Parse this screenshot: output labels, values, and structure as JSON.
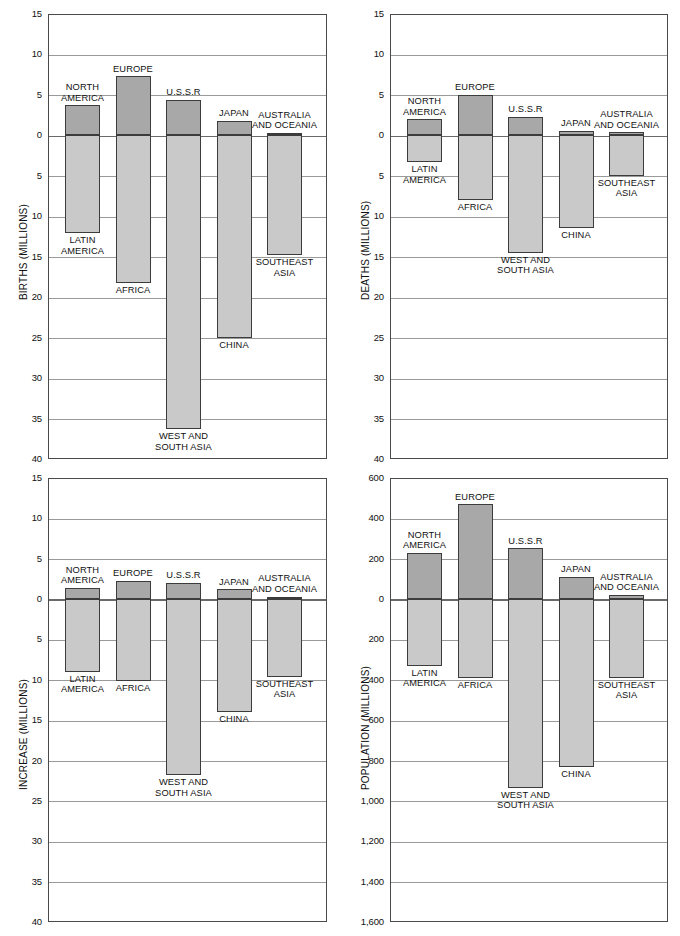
{
  "figure": {
    "regions": [
      "NORTH AMERICA",
      "LATIN AMERICA",
      "EUROPE",
      "AFRICA",
      "U.S.S.R",
      "WEST AND SOUTH ASIA",
      "JAPAN",
      "CHINA",
      "AUSTRALIA AND OCEANIA",
      "SOUTHEAST ASIA"
    ]
  },
  "chart_data": [
    {
      "id": "births",
      "type": "bar",
      "title": "",
      "ylabel": "BIRTHS (MILLIONS)",
      "xlabel": "",
      "ylim": [
        -40,
        15
      ],
      "grid": true,
      "legend": "none",
      "yticks": [
        15,
        10,
        5,
        0,
        5,
        10,
        15,
        20,
        25,
        30,
        35,
        40
      ],
      "ytick_values": [
        15,
        10,
        5,
        0,
        -5,
        -10,
        -15,
        -20,
        -25,
        -30,
        -35,
        -40
      ],
      "pairs": [
        {
          "top_label": "NORTH\nAMERICA",
          "bottom_label": "LATIN\nAMERICA",
          "up": 3.7,
          "down": -12.1
        },
        {
          "top_label": "EUROPE",
          "bottom_label": "AFRICA",
          "up": 7.3,
          "down": -18.2
        },
        {
          "top_label": "U.S.S.R",
          "bottom_label": "WEST AND\nSOUTH ASIA",
          "up": 4.4,
          "down": -36.3
        },
        {
          "top_label": "JAPAN",
          "bottom_label": "CHINA",
          "up": 1.8,
          "down": -25.1
        },
        {
          "top_label": "AUSTRALIA\nAND OCEANIA",
          "bottom_label": "SOUTHEAST\nASIA",
          "up": 0.3,
          "down": -14.8
        }
      ]
    },
    {
      "id": "deaths",
      "type": "bar",
      "title": "",
      "ylabel": "DEATHS (MILLIONS)",
      "xlabel": "",
      "ylim": [
        -40,
        15
      ],
      "grid": true,
      "legend": "none",
      "yticks": [
        15,
        10,
        5,
        0,
        5,
        10,
        15,
        20,
        25,
        30,
        35,
        40
      ],
      "ytick_values": [
        15,
        10,
        5,
        0,
        -5,
        -10,
        -15,
        -20,
        -25,
        -30,
        -35,
        -40
      ],
      "pairs": [
        {
          "top_label": "NORTH\nAMERICA",
          "bottom_label": "LATIN\nAMERICA",
          "up": 2.0,
          "down": -3.3
        },
        {
          "top_label": "EUROPE",
          "bottom_label": "AFRICA",
          "up": 5.0,
          "down": -8.0
        },
        {
          "top_label": "U.S.S.R",
          "bottom_label": "WEST AND\nSOUTH ASIA",
          "up": 2.3,
          "down": -14.5
        },
        {
          "top_label": "JAPAN",
          "bottom_label": "CHINA",
          "up": 0.6,
          "down": -11.5
        },
        {
          "top_label": "AUSTRALIA\nAND OCEANIA",
          "bottom_label": "SOUTHEAST\nASIA",
          "up": 0.4,
          "down": -5.0
        }
      ]
    },
    {
      "id": "increase",
      "type": "bar",
      "title": "",
      "ylabel": "INCREASE (MILLIONS)",
      "xlabel": "",
      "ylim": [
        -40,
        15
      ],
      "grid": true,
      "legend": "none",
      "yticks": [
        15,
        10,
        5,
        0,
        5,
        10,
        15,
        20,
        25,
        30,
        35,
        40
      ],
      "ytick_values": [
        15,
        10,
        5,
        0,
        -5,
        -10,
        -15,
        -20,
        -25,
        -30,
        -35,
        -40
      ],
      "pairs": [
        {
          "top_label": "NORTH\nAMERICA",
          "bottom_label": "LATIN\nAMERICA",
          "up": 1.4,
          "down": -9.0
        },
        {
          "top_label": "EUROPE",
          "bottom_label": "AFRICA",
          "up": 2.3,
          "down": -10.2
        },
        {
          "top_label": "U.S.S.R",
          "bottom_label": "WEST AND\nSOUTH ASIA",
          "up": 2.0,
          "down": -21.8
        },
        {
          "top_label": "JAPAN",
          "bottom_label": "CHINA",
          "up": 1.2,
          "down": -14.0
        },
        {
          "top_label": "AUSTRALIA\nAND OCEANIA",
          "bottom_label": "SOUTHEAST\nASIA",
          "up": 0.3,
          "down": -9.6
        }
      ]
    },
    {
      "id": "population",
      "type": "bar",
      "title": "",
      "ylabel": "POPULATION (MILLIONS)",
      "xlabel": "",
      "ylim": [
        -1600,
        600
      ],
      "grid": true,
      "legend": "none",
      "yticks": [
        "600",
        "400",
        "200",
        "0",
        "200",
        "400",
        "600",
        "800",
        "1,000",
        "1,200",
        "1,400",
        "1,600"
      ],
      "ytick_values": [
        600,
        400,
        200,
        0,
        -200,
        -400,
        -600,
        -800,
        -1000,
        -1200,
        -1400,
        -1600
      ],
      "pairs": [
        {
          "top_label": "NORTH\nAMERICA",
          "bottom_label": "LATIN\nAMERICA",
          "up": 228,
          "down": -330
        },
        {
          "top_label": "EUROPE",
          "bottom_label": "AFRICA",
          "up": 470,
          "down": -392
        },
        {
          "top_label": "U.S.S.R",
          "bottom_label": "WEST AND\nSOUTH ASIA",
          "up": 252,
          "down": -935
        },
        {
          "top_label": "JAPAN",
          "bottom_label": "CHINA",
          "up": 110,
          "down": -830
        },
        {
          "top_label": "AUSTRALIA\nAND OCEANIA",
          "bottom_label": "SOUTHEAST\nASIA",
          "up": 20,
          "down": -390
        }
      ]
    }
  ],
  "colors": {
    "bar_positive": "#a8a8a8",
    "bar_negative": "#c9c9c9",
    "bar_border": "#3c3c3c",
    "grid": "#9a9a9a",
    "frame": "#4a4a4a",
    "text": "#111111"
  }
}
